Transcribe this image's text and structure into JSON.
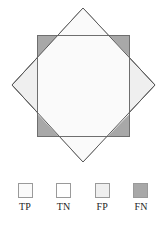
{
  "figure": {
    "type": "venn-overlap-diagram",
    "background_color": "#ffffff"
  },
  "diagram": {
    "square": {
      "label": "FN",
      "x": 37,
      "y": 35,
      "width": 92,
      "height": 101,
      "fill": "#a8a8a8",
      "stroke": "#6e6e6e",
      "stroke_width": 1
    },
    "diamond": {
      "label": "FP",
      "points": "83,8 155,85 83,162 12,85",
      "fill": "#efefef",
      "stroke": "#5a5a5a",
      "stroke_width": 1,
      "top_vertex": "83,8",
      "right_vertex": "155,85",
      "bottom_vertex": "83,162",
      "left_vertex": "12,85"
    },
    "intersection": {
      "label": "TP",
      "fill": "#fafafa",
      "points": "83,8 129,57 129,114 83,162 37,114 37,57"
    },
    "outside": {
      "label": "TN",
      "fill": "#ffffff"
    }
  },
  "legend": {
    "items": [
      {
        "label": "TP",
        "color": "#fafafa",
        "border": "#9a9a9a"
      },
      {
        "label": "TN",
        "color": "#ffffff",
        "border": "#9a9a9a"
      },
      {
        "label": "FP",
        "color": "#efefef",
        "border": "#9a9a9a"
      },
      {
        "label": "FN",
        "color": "#a8a8a8",
        "border": "#9a9a9a"
      }
    ]
  }
}
